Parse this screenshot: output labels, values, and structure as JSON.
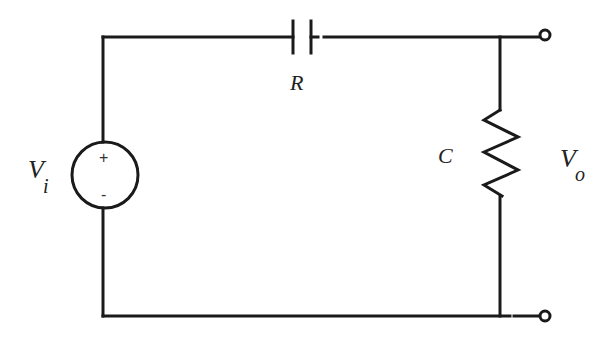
{
  "diagram": {
    "type": "circuit",
    "colors": {
      "stroke": "#1a1a1a",
      "background": "#ffffff"
    },
    "labels": {
      "series_component": "R",
      "shunt_component": "C",
      "input_voltage": "V",
      "input_subscript": "i",
      "output_voltage": "V",
      "output_subscript": "o"
    },
    "source": {
      "plus": "+",
      "minus": "-"
    },
    "components": [
      {
        "id": "series",
        "symbol": "capacitor",
        "label": "R",
        "position": "top wire"
      },
      {
        "id": "shunt",
        "symbol": "resistor",
        "label": "C",
        "position": "right branch"
      },
      {
        "id": "source",
        "symbol": "voltage-source",
        "label": "Vi",
        "position": "left branch"
      }
    ],
    "terminals": [
      {
        "id": "out-top",
        "position": "top-right"
      },
      {
        "id": "out-bottom",
        "position": "bottom-right"
      }
    ]
  }
}
